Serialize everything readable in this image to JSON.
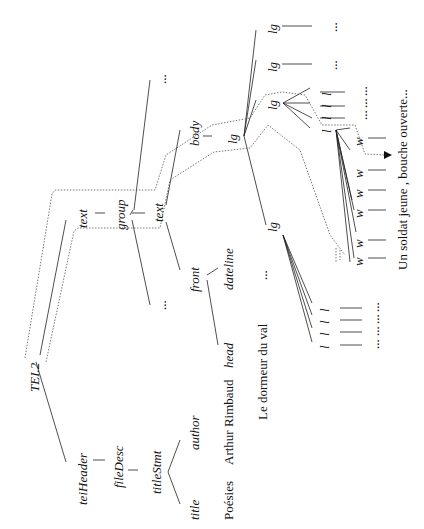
{
  "diagram": {
    "orientation": "rotated -90deg",
    "nodes": {
      "root": "TEI.2",
      "teiHeader": "teiHeader",
      "fileDesc": "fileDesc",
      "titleStmt": "titleStmt",
      "title": "title",
      "author": "author",
      "text_outer": "text",
      "group": "group",
      "text_inner": "text",
      "front": "front",
      "head": "head",
      "dateline": "dateline",
      "body": "body",
      "lg_main": "lg",
      "lg_1": "lg",
      "lg_2": "lg",
      "lg_3": "lg",
      "lg_4": "lg",
      "l": "l",
      "w": "w",
      "ellipsis": "..."
    },
    "texts": {
      "title_value": "Poésies",
      "author_value": "Arthur Rimbaud",
      "head_value": "Le dormeur du val",
      "line_value": "Un  soldat  jeune  ,  bouche  ouverte..."
    },
    "colors": {
      "line": "#222222",
      "dotted": "#555555",
      "background": "#ffffff"
    }
  }
}
